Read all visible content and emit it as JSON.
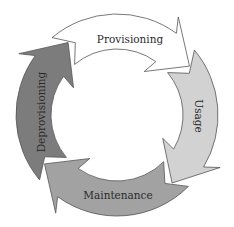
{
  "diagram": {
    "type": "cycle",
    "center": [
      117,
      115
    ],
    "outer_radius": 101,
    "inner_radius": 66,
    "stages": [
      {
        "label": "Provisioning",
        "fill": "#ffffff",
        "start_deg": -130,
        "end_deg": -40,
        "label_pos": [
          130,
          40
        ],
        "label_rotate": 0
      },
      {
        "label": "Usage",
        "fill": "#d2d2d2",
        "start_deg": -40,
        "end_deg": 45,
        "label_pos": [
          198,
          116
        ],
        "label_rotate": 90
      },
      {
        "label": "Maintenance",
        "fill": "#a2a2a2",
        "start_deg": 45,
        "end_deg": 140,
        "label_pos": [
          118,
          196
        ],
        "label_rotate": 0
      },
      {
        "label": "Deprovisioning",
        "fill": "#7c7c7c",
        "start_deg": 140,
        "end_deg": 230,
        "label_pos": [
          42,
          112
        ],
        "label_rotate": -90
      }
    ]
  }
}
